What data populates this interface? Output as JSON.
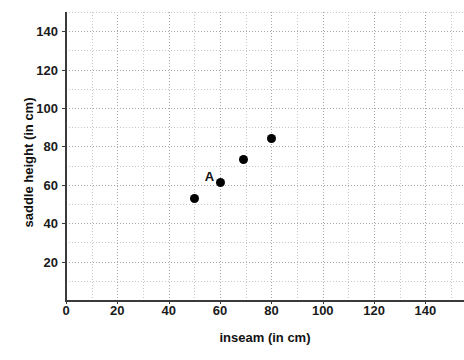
{
  "chart_data": {
    "type": "scatter",
    "title": "",
    "xlabel": "inseam (in cm)",
    "ylabel": "saddle height  (in cm)",
    "xlim": [
      0,
      155
    ],
    "ylim": [
      0,
      150
    ],
    "xticks": [
      0,
      20,
      40,
      60,
      80,
      100,
      120,
      140
    ],
    "yticks": [
      20,
      40,
      60,
      80,
      100,
      120,
      140
    ],
    "grid": "dotted minor gridlines every 10 units, darker every 20 units",
    "legend": "none",
    "points": [
      {
        "label": "",
        "x": 50,
        "y": 53
      },
      {
        "label": "A",
        "x": 60,
        "y": 61
      },
      {
        "label": "",
        "x": 69,
        "y": 73
      },
      {
        "label": "",
        "x": 80,
        "y": 84
      }
    ],
    "annotations": [
      {
        "text": "A",
        "target_x": 60,
        "target_y": 61
      }
    ],
    "marker": {
      "shape": "circle",
      "color": "#000000",
      "size": 9
    }
  },
  "axis": {
    "x_title": "inseam (in cm)",
    "y_title": "saddle height  (in cm)",
    "x_tick_labels": [
      "0",
      "20",
      "40",
      "60",
      "80",
      "100",
      "120",
      "140"
    ],
    "y_tick_labels": [
      "20",
      "40",
      "60",
      "80",
      "100",
      "120",
      "140"
    ]
  },
  "colors": {
    "axis": "#3a3a3a",
    "grid_minor": "#c8c8c8",
    "grid_major": "#a6a6a6",
    "marker": "#000000",
    "text": "#111111",
    "background": "#ffffff"
  }
}
